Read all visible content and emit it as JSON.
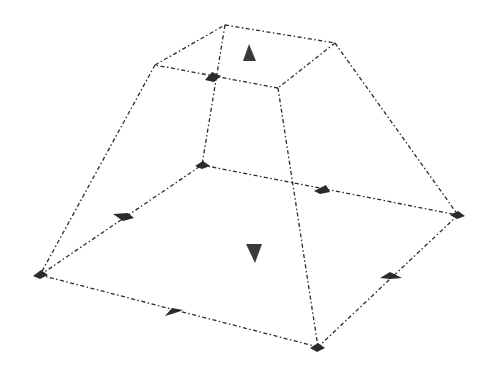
{
  "diagram": {
    "type": "frustum-wireframe",
    "colors": {
      "line": "#2a2a2a",
      "marker": "#2b2b2b",
      "background": "#ffffff"
    },
    "top_face": {
      "vertices": [
        [
          155,
          65
        ],
        [
          225,
          25
        ],
        [
          335,
          43
        ],
        [
          278,
          88
        ]
      ],
      "arrow": {
        "direction": "up",
        "position": [
          249,
          53
        ]
      }
    },
    "bottom_face": {
      "vertices": [
        [
          40,
          275
        ],
        [
          202,
          165
        ],
        [
          458,
          215
        ],
        [
          318,
          347
        ]
      ],
      "arrow": {
        "direction": "down",
        "position": [
          254,
          256
        ]
      }
    },
    "edge_markers": [
      [
        213,
        77
      ],
      [
        125,
        217
      ],
      [
        323,
        190
      ],
      [
        174,
        312
      ],
      [
        390,
        276
      ]
    ],
    "corner_markers": [
      [
        40,
        275
      ],
      [
        202,
        165
      ],
      [
        458,
        215
      ],
      [
        318,
        347
      ]
    ]
  }
}
